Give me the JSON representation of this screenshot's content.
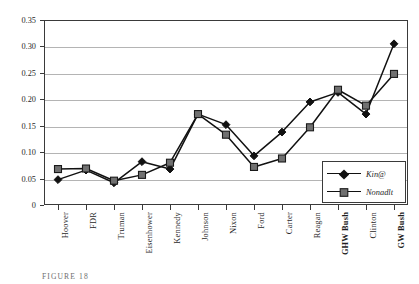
{
  "chart_data": {
    "type": "line",
    "title": "",
    "xlabel": "",
    "ylabel": "",
    "ylim": [
      0,
      0.35
    ],
    "yticks": [
      "0",
      "0.05",
      "0.10",
      "0.15",
      "0.20",
      "0.25",
      "0.30",
      "0.35"
    ],
    "ytick_values": [
      0,
      0.05,
      0.1,
      0.15,
      0.2,
      0.25,
      0.3,
      0.35
    ],
    "grid": true,
    "legend_position": "inside-bottom-right",
    "categories": [
      "Hoover",
      "FDR",
      "Truman",
      "Eisenhower",
      "Kennedy",
      "Johnson",
      "Nixon",
      "Ford",
      "Carter",
      "Reagan",
      "GHW Bush",
      "Clinton",
      "GW Bush"
    ],
    "series": [
      {
        "name": "Kin@",
        "marker": "diamond",
        "color": "#111111",
        "values": [
          0.048,
          0.066,
          0.042,
          0.082,
          0.068,
          0.172,
          0.152,
          0.093,
          0.138,
          0.195,
          0.213,
          0.172,
          0.305
        ]
      },
      {
        "name": "Nonadlt",
        "marker": "square",
        "color": "#707070",
        "values": [
          0.068,
          0.069,
          0.046,
          0.057,
          0.08,
          0.172,
          0.133,
          0.072,
          0.088,
          0.147,
          0.218,
          0.188,
          0.248
        ]
      }
    ]
  },
  "legend": {
    "entries": [
      {
        "label": "Kin@"
      },
      {
        "label": "Nonadlt"
      }
    ]
  },
  "caption": {
    "text": "FIGURE 18"
  },
  "colors": {
    "kin_line": "#111111",
    "nonkin_marker": "#707070",
    "grid": "#b4b4b4",
    "axis": "#3a3a3a"
  }
}
